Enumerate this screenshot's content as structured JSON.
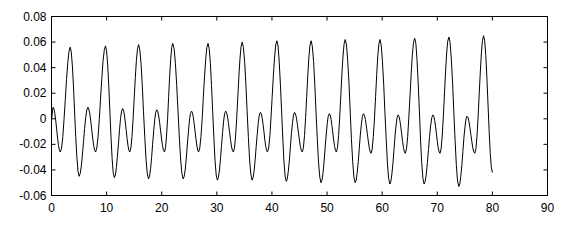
{
  "chart_data": {
    "type": "line",
    "title": "",
    "xlabel": "",
    "ylabel": "",
    "xlim": [
      0,
      90
    ],
    "ylim": [
      -0.06,
      0.08
    ],
    "grid": false,
    "legend": null,
    "x_ticks": [
      0,
      10,
      20,
      30,
      40,
      50,
      60,
      70,
      80,
      90
    ],
    "x_tick_labels": [
      "0",
      "10",
      "20",
      "30",
      "40",
      "50",
      "60",
      "70",
      "80",
      "90"
    ],
    "y_ticks": [
      -0.06,
      -0.04,
      -0.02,
      0,
      0.02,
      0.04,
      0.06,
      0.08
    ],
    "y_tick_labels": [
      "-0.06",
      "-0.04",
      "-0.02",
      "0",
      "0.02",
      "0.04",
      "0.06",
      "0.08"
    ],
    "line_color": "#000000",
    "series": [
      {
        "name": "signal",
        "x_range": [
          0,
          80
        ],
        "description": "Periodic oscillation, period ~6.3, each cycle has a main peak (~0.056 rising to ~0.065) and a secondary peak (~0.008), troughs near -0.026 and -0.045 to -0.053",
        "main_peaks": [
          {
            "x": 3.4,
            "y": 0.056
          },
          {
            "x": 9.8,
            "y": 0.057
          },
          {
            "x": 15.8,
            "y": 0.058
          },
          {
            "x": 22.0,
            "y": 0.059
          },
          {
            "x": 28.4,
            "y": 0.059
          },
          {
            "x": 34.6,
            "y": 0.06
          },
          {
            "x": 40.9,
            "y": 0.061
          },
          {
            "x": 47.1,
            "y": 0.061
          },
          {
            "x": 53.3,
            "y": 0.062
          },
          {
            "x": 59.6,
            "y": 0.062
          },
          {
            "x": 65.9,
            "y": 0.063
          },
          {
            "x": 72.1,
            "y": 0.064
          },
          {
            "x": 78.4,
            "y": 0.065
          }
        ],
        "secondary_peaks": [
          {
            "x": 0.3,
            "y": 0.009
          },
          {
            "x": 6.6,
            "y": 0.009
          },
          {
            "x": 12.9,
            "y": 0.008
          },
          {
            "x": 19.1,
            "y": 0.007
          },
          {
            "x": 25.4,
            "y": 0.006
          },
          {
            "x": 31.6,
            "y": 0.006
          },
          {
            "x": 37.9,
            "y": 0.005
          },
          {
            "x": 44.1,
            "y": 0.005
          },
          {
            "x": 50.4,
            "y": 0.004
          },
          {
            "x": 56.6,
            "y": 0.004
          },
          {
            "x": 62.9,
            "y": 0.003
          },
          {
            "x": 69.2,
            "y": 0.003
          },
          {
            "x": 75.4,
            "y": 0.002
          }
        ],
        "deep_troughs": [
          {
            "x": 5.0,
            "y": -0.045
          },
          {
            "x": 11.4,
            "y": -0.046
          },
          {
            "x": 17.6,
            "y": -0.047
          },
          {
            "x": 23.9,
            "y": -0.047
          },
          {
            "x": 30.1,
            "y": -0.048
          },
          {
            "x": 36.4,
            "y": -0.048
          },
          {
            "x": 42.6,
            "y": -0.049
          },
          {
            "x": 48.9,
            "y": -0.05
          },
          {
            "x": 55.1,
            "y": -0.05
          },
          {
            "x": 61.4,
            "y": -0.051
          },
          {
            "x": 67.6,
            "y": -0.051
          },
          {
            "x": 73.9,
            "y": -0.053
          }
        ],
        "shallow_troughs": [
          {
            "x": 1.6,
            "y": -0.026
          },
          {
            "x": 8.0,
            "y": -0.026
          },
          {
            "x": 14.2,
            "y": -0.026
          },
          {
            "x": 20.5,
            "y": -0.026
          },
          {
            "x": 26.7,
            "y": -0.026
          },
          {
            "x": 33.0,
            "y": -0.026
          },
          {
            "x": 39.2,
            "y": -0.026
          },
          {
            "x": 45.5,
            "y": -0.026
          },
          {
            "x": 51.7,
            "y": -0.026
          },
          {
            "x": 58.0,
            "y": -0.027
          },
          {
            "x": 64.2,
            "y": -0.027
          },
          {
            "x": 70.5,
            "y": -0.027
          },
          {
            "x": 76.8,
            "y": -0.027
          }
        ],
        "end_point": {
          "x": 80,
          "y": -0.042
        }
      }
    ]
  }
}
